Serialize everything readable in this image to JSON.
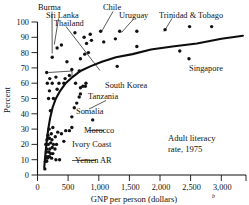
{
  "chart_data": {
    "type": "scatter",
    "title": "",
    "annotation_note": [
      "Adult literacy",
      "rate, 1975"
    ],
    "xlabel": "GNP per person (dollars)",
    "xlabel_superscript": "b",
    "ylabel": "Percent",
    "xlim": [
      0,
      3400
    ],
    "ylim": [
      0,
      100
    ],
    "xticks": [
      0,
      500,
      1000,
      1500,
      2000,
      2500,
      3000
    ],
    "xtick_labels": [
      "0",
      "500",
      "1,000",
      "1,500",
      "2,000",
      "2,500",
      "3,000"
    ],
    "yticks": [
      0,
      10,
      20,
      30,
      40,
      50,
      60,
      70,
      80,
      90,
      100
    ],
    "ytick_labels": [
      "0",
      "10",
      "20",
      "30",
      "40",
      "50",
      "60",
      "70",
      "80",
      "90",
      "100"
    ],
    "grid": false,
    "legend": false,
    "point_color": "#111111",
    "curve_color": "#0d0d0d",
    "fit_curve_label": "fitted logarithmic trend",
    "fit_curve": [
      {
        "x": 110,
        "y": 5
      },
      {
        "x": 130,
        "y": 14
      },
      {
        "x": 150,
        "y": 22
      },
      {
        "x": 175,
        "y": 30
      },
      {
        "x": 205,
        "y": 37
      },
      {
        "x": 245,
        "y": 44
      },
      {
        "x": 300,
        "y": 50
      },
      {
        "x": 370,
        "y": 55
      },
      {
        "x": 460,
        "y": 60
      },
      {
        "x": 570,
        "y": 64
      },
      {
        "x": 700,
        "y": 68
      },
      {
        "x": 860,
        "y": 71
      },
      {
        "x": 1050,
        "y": 74
      },
      {
        "x": 1280,
        "y": 77
      },
      {
        "x": 1550,
        "y": 79
      },
      {
        "x": 1850,
        "y": 82
      },
      {
        "x": 2200,
        "y": 84
      },
      {
        "x": 2600,
        "y": 86
      },
      {
        "x": 3000,
        "y": 89
      },
      {
        "x": 3350,
        "y": 91
      }
    ],
    "points": [
      {
        "x": 120,
        "y": 4
      },
      {
        "x": 130,
        "y": 9
      },
      {
        "x": 150,
        "y": 9
      },
      {
        "x": 160,
        "y": 11
      },
      {
        "x": 140,
        "y": 12
      },
      {
        "x": 175,
        "y": 12
      },
      {
        "x": 195,
        "y": 12
      },
      {
        "x": 230,
        "y": 11
      },
      {
        "x": 300,
        "y": 10
      },
      {
        "x": 360,
        "y": 10
      },
      {
        "x": 145,
        "y": 15
      },
      {
        "x": 185,
        "y": 15
      },
      {
        "x": 215,
        "y": 14
      },
      {
        "x": 250,
        "y": 14
      },
      {
        "x": 150,
        "y": 17
      },
      {
        "x": 200,
        "y": 17
      },
      {
        "x": 240,
        "y": 18
      },
      {
        "x": 285,
        "y": 17
      },
      {
        "x": 135,
        "y": 20
      },
      {
        "x": 175,
        "y": 20
      },
      {
        "x": 215,
        "y": 21
      },
      {
        "x": 260,
        "y": 20
      },
      {
        "x": 310,
        "y": 20
      },
      {
        "x": 155,
        "y": 23
      },
      {
        "x": 195,
        "y": 24
      },
      {
        "x": 235,
        "y": 23
      },
      {
        "x": 290,
        "y": 25
      },
      {
        "x": 430,
        "y": 22
      },
      {
        "x": 170,
        "y": 26
      },
      {
        "x": 225,
        "y": 27
      },
      {
        "x": 330,
        "y": 28
      },
      {
        "x": 390,
        "y": 27
      },
      {
        "x": 460,
        "y": 29
      },
      {
        "x": 520,
        "y": 29
      },
      {
        "x": 190,
        "y": 30
      },
      {
        "x": 250,
        "y": 31
      },
      {
        "x": 560,
        "y": 31
      },
      {
        "x": 900,
        "y": 36
      },
      {
        "x": 560,
        "y": 38
      },
      {
        "x": 210,
        "y": 42
      },
      {
        "x": 600,
        "y": 44
      },
      {
        "x": 640,
        "y": 47
      },
      {
        "x": 180,
        "y": 50
      },
      {
        "x": 260,
        "y": 50
      },
      {
        "x": 680,
        "y": 51
      },
      {
        "x": 700,
        "y": 53
      },
      {
        "x": 195,
        "y": 55
      },
      {
        "x": 320,
        "y": 56
      },
      {
        "x": 700,
        "y": 57
      },
      {
        "x": 740,
        "y": 58
      },
      {
        "x": 780,
        "y": 58
      },
      {
        "x": 160,
        "y": 60
      },
      {
        "x": 240,
        "y": 60
      },
      {
        "x": 350,
        "y": 60
      },
      {
        "x": 430,
        "y": 60
      },
      {
        "x": 620,
        "y": 60
      },
      {
        "x": 790,
        "y": 60
      },
      {
        "x": 200,
        "y": 63
      },
      {
        "x": 300,
        "y": 64
      },
      {
        "x": 450,
        "y": 63
      },
      {
        "x": 520,
        "y": 65
      },
      {
        "x": 150,
        "y": 67
      },
      {
        "x": 560,
        "y": 69
      },
      {
        "x": 680,
        "y": 68
      },
      {
        "x": 1300,
        "y": 71
      },
      {
        "x": 2470,
        "y": 76
      },
      {
        "x": 480,
        "y": 74
      },
      {
        "x": 700,
        "y": 76
      },
      {
        "x": 240,
        "y": 77
      },
      {
        "x": 770,
        "y": 79
      },
      {
        "x": 830,
        "y": 80
      },
      {
        "x": 1620,
        "y": 84
      },
      {
        "x": 2320,
        "y": 81
      },
      {
        "x": 320,
        "y": 83
      },
      {
        "x": 390,
        "y": 85
      },
      {
        "x": 800,
        "y": 86
      },
      {
        "x": 880,
        "y": 88
      },
      {
        "x": 1080,
        "y": 87
      },
      {
        "x": 1270,
        "y": 89
      },
      {
        "x": 760,
        "y": 90
      },
      {
        "x": 860,
        "y": 92
      },
      {
        "x": 610,
        "y": 93
      },
      {
        "x": 1030,
        "y": 94
      },
      {
        "x": 1340,
        "y": 94
      },
      {
        "x": 1620,
        "y": 94
      },
      {
        "x": 2080,
        "y": 95
      },
      {
        "x": 2480,
        "y": 97
      },
      {
        "x": 2840,
        "y": 97
      }
    ],
    "annotations": [
      {
        "name": "Burma",
        "label": "Burma",
        "value_x": 240,
        "value_y": 77
      },
      {
        "name": "Sri Lanka",
        "label": "Sri Lanka",
        "value_x": 320,
        "value_y": 83
      },
      {
        "name": "Thailand",
        "label": "Thailand",
        "value_x": 390,
        "value_y": 85
      },
      {
        "name": "Chile",
        "label": "Chile",
        "value_x": 1030,
        "value_y": 94
      },
      {
        "name": "Uruguay",
        "label": "Uruguay",
        "value_x": 1340,
        "value_y": 94
      },
      {
        "name": "Trinidad & Tobago",
        "label": "Trinidad & Tobago",
        "value_x": 2080,
        "value_y": 95
      },
      {
        "name": "Singapore",
        "label": "Singapore",
        "value_x": 2470,
        "value_y": 76
      },
      {
        "name": "South Korea",
        "label": "South Korea",
        "value_x": 790,
        "value_y": 60
      },
      {
        "name": "Tanzania",
        "label": "Tanzania",
        "value_x": 700,
        "value_y": 53
      },
      {
        "name": "Somalia",
        "label": "Somalia",
        "value_x": 150,
        "value_y": 67
      },
      {
        "name": "Morocco",
        "label": "Morocco",
        "value_x": 560,
        "value_y": 31
      },
      {
        "name": "Ivory Coast",
        "label": "Ivory Coast",
        "value_x": 430,
        "value_y": 22
      },
      {
        "name": "Yemen AR",
        "label": "Yemen AR",
        "value_x": 300,
        "value_y": 10
      }
    ]
  },
  "figure": {
    "ylabel": "Percent",
    "xlabel_main": "GNP per person (dollars)",
    "xlabel_sup": "b",
    "note_line1": "Adult literacy",
    "note_line2": "rate, 1975",
    "labels": {
      "burma": "Burma",
      "sri_lanka": "Sri Lanka",
      "thailand": "Thailand",
      "chile": "Chile",
      "uruguay": "Uruguay",
      "trinidad": "Trinidad & Tobago",
      "singapore": "Singapore",
      "south_korea": "South Korea",
      "tanzania": "Tanzania",
      "somalia": "Somalia",
      "morocco": "Morocco",
      "ivory_coast": "Ivory Coast",
      "yemen": "Yemen AR"
    },
    "yticks": {
      "t0": "0",
      "t10": "10",
      "t20": "20",
      "t30": "30",
      "t40": "40",
      "t50": "50",
      "t60": "60",
      "t70": "70",
      "t80": "80",
      "t90": "90",
      "t100": "100"
    },
    "xticks": {
      "t0": "0",
      "t500": "500",
      "t1000": "1,000",
      "t1500": "1,500",
      "t2000": "2,000",
      "t2500": "2,500",
      "t3000": "3,000"
    }
  }
}
